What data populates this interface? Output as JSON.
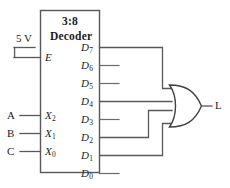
{
  "diagram": {
    "component": {
      "name_line1": "3:8",
      "name_line2": "Decoder"
    },
    "power": {
      "label": "5 V",
      "connects_to": "E"
    },
    "enable_input": {
      "label": "E"
    },
    "select_inputs": [
      {
        "external": "A",
        "pin": "X",
        "pin_sub": "2"
      },
      {
        "external": "B",
        "pin": "X",
        "pin_sub": "1"
      },
      {
        "external": "C",
        "pin": "X",
        "pin_sub": "0"
      }
    ],
    "outputs": [
      {
        "label": "D",
        "sub": "7",
        "connected": true
      },
      {
        "label": "D",
        "sub": "6",
        "connected": false
      },
      {
        "label": "D",
        "sub": "5",
        "connected": false
      },
      {
        "label": "D",
        "sub": "4",
        "connected": true
      },
      {
        "label": "D",
        "sub": "3",
        "connected": false
      },
      {
        "label": "D",
        "sub": "2",
        "connected": true
      },
      {
        "label": "D",
        "sub": "1",
        "connected": true
      },
      {
        "label": "D",
        "sub": "0",
        "connected": false
      }
    ],
    "gate": {
      "type": "OR",
      "output_label": "L"
    },
    "colors": {
      "wire": "#58585a",
      "text": "#1c1c1c",
      "background": "#ffffff"
    }
  }
}
